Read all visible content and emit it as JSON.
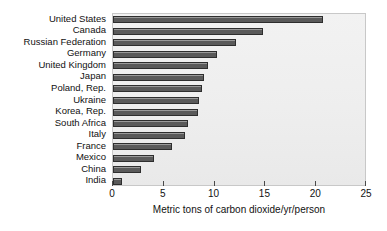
{
  "chart_data": {
    "type": "bar",
    "orientation": "horizontal",
    "title": "",
    "xlabel": "Metric tons of carbon dioxide/yr/person",
    "ylabel": "",
    "xlim": [
      0,
      25
    ],
    "xticks": [
      0,
      5,
      10,
      15,
      20,
      25
    ],
    "xtick_labels": [
      "0",
      "5",
      "10",
      "15",
      "20",
      "25"
    ],
    "grid": false,
    "legend": null,
    "categories": [
      "United States",
      "Canada",
      "Russian Federation",
      "Germany",
      "United Kingdom",
      "Japan",
      "Poland, Rep.",
      "Ukraine",
      "Korea, Rep.",
      "South Africa",
      "Italy",
      "France",
      "Mexico",
      "China",
      "India"
    ],
    "values": [
      20.8,
      14.9,
      12.2,
      10.3,
      9.4,
      9.0,
      8.8,
      8.5,
      8.4,
      7.4,
      7.1,
      5.9,
      4.1,
      2.8,
      0.9
    ],
    "bar_color": "#5a5a5a",
    "bar_edge_color": "#2e2e2e",
    "plot_background": "#efefef"
  }
}
